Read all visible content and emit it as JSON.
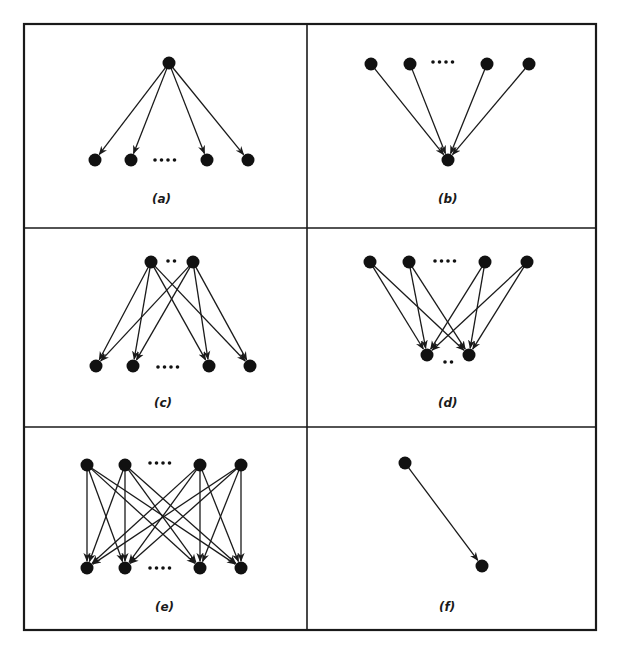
{
  "figure": {
    "frame": {
      "x": 24,
      "y": 24,
      "width": 572,
      "height": 606
    },
    "dividers": {
      "vertical_x": 307,
      "horizontal_y": [
        228,
        427
      ]
    },
    "colors": {
      "ink": "#1a1a1a",
      "background": "#ffffff"
    },
    "node_radius": 6.5,
    "panels": [
      {
        "id": "a",
        "label": "(a)",
        "label_pos": [
          152,
          203
        ],
        "description": "one-to-many: single source node with arrows to multiple target nodes",
        "nodes": [
          {
            "id": "s1",
            "x": 169,
            "y": 63
          },
          {
            "id": "t1",
            "x": 95,
            "y": 160
          },
          {
            "id": "t2",
            "x": 131,
            "y": 160
          },
          {
            "id": "t3",
            "x": 207,
            "y": 160
          },
          {
            "id": "t4",
            "x": 248,
            "y": 160
          }
        ],
        "edges": [
          [
            "s1",
            "t1"
          ],
          [
            "s1",
            "t2"
          ],
          [
            "s1",
            "t3"
          ],
          [
            "s1",
            "t4"
          ]
        ],
        "ellipses": [
          {
            "x": 155,
            "y": 160,
            "dots": 4,
            "gap": 6.5
          }
        ]
      },
      {
        "id": "b",
        "label": "(b)",
        "label_pos": [
          438,
          203
        ],
        "description": "many-to-one: multiple source nodes with arrows converging on a single target node",
        "nodes": [
          {
            "id": "s1",
            "x": 371,
            "y": 64
          },
          {
            "id": "s2",
            "x": 410,
            "y": 64
          },
          {
            "id": "s3",
            "x": 487,
            "y": 64
          },
          {
            "id": "s4",
            "x": 529,
            "y": 64
          },
          {
            "id": "t1",
            "x": 448,
            "y": 160
          }
        ],
        "edges": [
          [
            "s1",
            "t1"
          ],
          [
            "s2",
            "t1"
          ],
          [
            "s3",
            "t1"
          ],
          [
            "s4",
            "t1"
          ]
        ],
        "ellipses": [
          {
            "x": 433,
            "y": 62,
            "dots": 4,
            "gap": 6.5
          }
        ]
      },
      {
        "id": "c",
        "label": "(c)",
        "label_pos": [
          154,
          407
        ],
        "description": "few-to-many: two source nodes each connected to all target nodes",
        "nodes": [
          {
            "id": "s1",
            "x": 151,
            "y": 262
          },
          {
            "id": "s2",
            "x": 193,
            "y": 262
          },
          {
            "id": "t1",
            "x": 96,
            "y": 366
          },
          {
            "id": "t2",
            "x": 133,
            "y": 366
          },
          {
            "id": "t3",
            "x": 209,
            "y": 366
          },
          {
            "id": "t4",
            "x": 250,
            "y": 366
          }
        ],
        "edges": [
          [
            "s1",
            "t1"
          ],
          [
            "s1",
            "t2"
          ],
          [
            "s1",
            "t3"
          ],
          [
            "s1",
            "t4"
          ],
          [
            "s2",
            "t1"
          ],
          [
            "s2",
            "t2"
          ],
          [
            "s2",
            "t3"
          ],
          [
            "s2",
            "t4"
          ]
        ],
        "ellipses": [
          {
            "x": 168,
            "y": 261,
            "dots": 2,
            "gap": 6.5
          },
          {
            "x": 158,
            "y": 367,
            "dots": 4,
            "gap": 6.5
          }
        ]
      },
      {
        "id": "d",
        "label": "(d)",
        "label_pos": [
          438,
          407
        ],
        "description": "many-to-few: four source nodes each connected to two target nodes",
        "nodes": [
          {
            "id": "s1",
            "x": 370,
            "y": 262
          },
          {
            "id": "s2",
            "x": 409,
            "y": 262
          },
          {
            "id": "s3",
            "x": 485,
            "y": 262
          },
          {
            "id": "s4",
            "x": 527,
            "y": 262
          },
          {
            "id": "t1",
            "x": 427,
            "y": 355
          },
          {
            "id": "t2",
            "x": 469,
            "y": 355
          }
        ],
        "edges": [
          [
            "s1",
            "t1"
          ],
          [
            "s1",
            "t2"
          ],
          [
            "s2",
            "t1"
          ],
          [
            "s2",
            "t2"
          ],
          [
            "s3",
            "t1"
          ],
          [
            "s3",
            "t2"
          ],
          [
            "s4",
            "t1"
          ],
          [
            "s4",
            "t2"
          ]
        ],
        "ellipses": [
          {
            "x": 435,
            "y": 261,
            "dots": 4,
            "gap": 6.5
          },
          {
            "x": 445,
            "y": 362,
            "dots": 2,
            "gap": 6.5
          }
        ]
      },
      {
        "id": "e",
        "label": "(e)",
        "label_pos": [
          155,
          611
        ],
        "description": "many-to-many: complete bipartite connection between four source and four target nodes",
        "nodes": [
          {
            "id": "s1",
            "x": 87,
            "y": 465
          },
          {
            "id": "s2",
            "x": 125,
            "y": 465
          },
          {
            "id": "s3",
            "x": 200,
            "y": 465
          },
          {
            "id": "s4",
            "x": 241,
            "y": 465
          },
          {
            "id": "t1",
            "x": 87,
            "y": 568
          },
          {
            "id": "t2",
            "x": 125,
            "y": 568
          },
          {
            "id": "t3",
            "x": 200,
            "y": 568
          },
          {
            "id": "t4",
            "x": 241,
            "y": 568
          }
        ],
        "edges": [
          [
            "s1",
            "t1"
          ],
          [
            "s1",
            "t2"
          ],
          [
            "s1",
            "t3"
          ],
          [
            "s1",
            "t4"
          ],
          [
            "s2",
            "t1"
          ],
          [
            "s2",
            "t2"
          ],
          [
            "s2",
            "t3"
          ],
          [
            "s2",
            "t4"
          ],
          [
            "s3",
            "t1"
          ],
          [
            "s3",
            "t2"
          ],
          [
            "s3",
            "t3"
          ],
          [
            "s3",
            "t4"
          ],
          [
            "s4",
            "t1"
          ],
          [
            "s4",
            "t2"
          ],
          [
            "s4",
            "t3"
          ],
          [
            "s4",
            "t4"
          ]
        ],
        "ellipses": [
          {
            "x": 150,
            "y": 463,
            "dots": 4,
            "gap": 6.5
          },
          {
            "x": 150,
            "y": 568,
            "dots": 4,
            "gap": 6.5
          }
        ]
      },
      {
        "id": "f",
        "label": "(f)",
        "label_pos": [
          439,
          611
        ],
        "description": "one-to-one: single source node with arrow to single target node",
        "nodes": [
          {
            "id": "s1",
            "x": 405,
            "y": 463
          },
          {
            "id": "t1",
            "x": 482,
            "y": 566
          }
        ],
        "edges": [
          [
            "s1",
            "t1"
          ]
        ],
        "ellipses": []
      }
    ]
  }
}
